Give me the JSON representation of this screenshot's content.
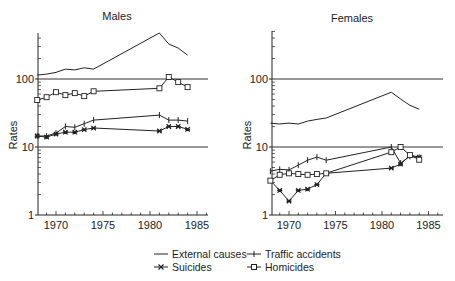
{
  "chart_data": [
    {
      "type": "line",
      "title": "Males",
      "xlabel": "",
      "ylabel": "Rates",
      "yscale": "log",
      "ylim": [
        1,
        800
      ],
      "xlim": [
        1968,
        1987
      ],
      "x_ticks": [
        1970,
        1975,
        1980,
        1985
      ],
      "y_ticks": [
        1,
        10,
        100
      ],
      "gridlines_y": [
        10,
        100
      ],
      "x": [
        1968,
        1969,
        1970,
        1971,
        1972,
        1973,
        1974,
        1981,
        1982,
        1983,
        1984
      ],
      "series": [
        {
          "name": "External causes",
          "marker": "none",
          "values": [
            114,
            118,
            125,
            140,
            136,
            146,
            140,
            475,
            327,
            285,
            225
          ]
        },
        {
          "name": "Traffic accidents",
          "marker": "plus",
          "values": [
            14.5,
            14.5,
            16,
            20,
            19.5,
            22,
            24.9,
            29.5,
            24.9,
            24.9,
            24
          ]
        },
        {
          "name": "Suicides",
          "marker": "star",
          "values": [
            14.5,
            14,
            15.5,
            16.5,
            16.5,
            18,
            19,
            17.2,
            20,
            20,
            18.2
          ]
        },
        {
          "name": "Homicides",
          "marker": "square",
          "values": [
            49,
            54,
            64,
            58,
            62,
            56,
            66,
            73,
            107,
            90,
            76
          ]
        }
      ]
    },
    {
      "type": "line",
      "title": "Females",
      "xlabel": "",
      "ylabel": "Rates",
      "yscale": "log",
      "ylim": [
        1,
        800
      ],
      "xlim": [
        1968,
        1987
      ],
      "x_ticks": [
        1970,
        1975,
        1980,
        1985
      ],
      "y_ticks": [
        1,
        10,
        100
      ],
      "gridlines_y": [
        10,
        100
      ],
      "x": [
        1968,
        1969,
        1970,
        1971,
        1972,
        1973,
        1974,
        1981,
        1982,
        1983,
        1984
      ],
      "series": [
        {
          "name": "External causes",
          "marker": "none",
          "values": [
            22.5,
            21.8,
            22.5,
            21.8,
            24,
            25.5,
            26.7,
            64,
            50.8,
            41,
            36
          ]
        },
        {
          "name": "Traffic accidents",
          "marker": "plus",
          "values": [
            4.4,
            4.7,
            4.6,
            5.4,
            6.4,
            7.1,
            6.4,
            10,
            5.8,
            7.3,
            7.0
          ]
        },
        {
          "name": "Suicides",
          "marker": "star",
          "values": [
            3.2,
            2.3,
            1.6,
            2.3,
            2.4,
            2.8,
            4.1,
            4.9,
            5.6,
            7.6,
            7.1
          ]
        },
        {
          "name": "Homicides",
          "marker": "square",
          "values": [
            3.2,
            3.9,
            4.1,
            4.0,
            3.9,
            4.0,
            4.1,
            8.4,
            10,
            7.6,
            6.5
          ]
        }
      ]
    }
  ],
  "panels": {
    "males": {
      "title": "Males",
      "ylabel": "Rates"
    },
    "females": {
      "title": "Females",
      "ylabel": "Rates"
    }
  },
  "axis": {
    "y_tick_labels": [
      "1",
      "10",
      "100"
    ],
    "x_tick_labels": [
      "1970",
      "1975",
      "1980",
      "1985"
    ]
  },
  "legend": {
    "items": [
      {
        "label": "External causes",
        "marker": "none"
      },
      {
        "label": "Traffic accidents",
        "marker": "plus"
      },
      {
        "label": "Suicides",
        "marker": "star"
      },
      {
        "label": "Homicides",
        "marker": "square"
      }
    ]
  },
  "colors": {
    "line": "#222222",
    "grid": "#333333",
    "background": "#ffffff"
  }
}
